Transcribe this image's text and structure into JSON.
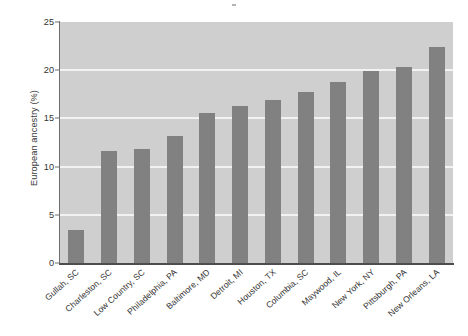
{
  "chart_data": {
    "type": "bar",
    "title": "",
    "xlabel": "",
    "ylabel": "European ancestry (%)",
    "ylim": [
      0,
      25
    ],
    "yticks": [
      0,
      5,
      10,
      15,
      20,
      25
    ],
    "ytick_labels": [
      "0",
      "5",
      "10",
      "15",
      "20",
      "25"
    ],
    "grid": "horizontal-white-gridlines",
    "legend": "none",
    "bar_color": "#818181",
    "plot_background": "#cfcfcf",
    "gridline_color": "#f2f2f2",
    "categories": [
      "Gullah, SC",
      "Charleston, SC",
      "Low Country, SC",
      "Philadelphia, PA",
      "Baltimore, MD",
      "Detroit, MI",
      "Houston, TX",
      "Columbia, SC",
      "Maywood, IL",
      "New York, NY",
      "Pittsburgh, PA",
      "New Orleans, LA"
    ],
    "values": [
      3.4,
      11.6,
      11.8,
      13.2,
      15.6,
      16.3,
      16.9,
      17.7,
      18.8,
      19.9,
      20.3,
      22.4
    ]
  }
}
